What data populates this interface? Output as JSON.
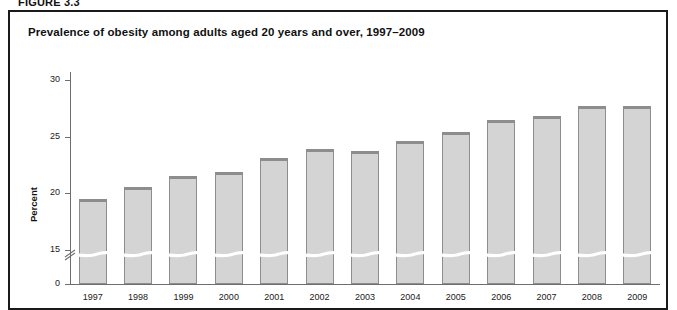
{
  "figure": {
    "label": "FIGURE 3.3"
  },
  "chart_title": "Prevalence of obesity among adults aged 20 years and over, 1997–2009",
  "axis": {
    "ylabel": "Percent",
    "yticks": [
      "0",
      "15",
      "20",
      "25",
      "30"
    ],
    "xlabel": ""
  },
  "chart_data": {
    "type": "bar",
    "title": "Prevalence of obesity among adults aged 20 years and over, 1997–2009",
    "xlabel": "",
    "ylabel": "Percent",
    "categories": [
      "1997",
      "1998",
      "1999",
      "2000",
      "2001",
      "2002",
      "2003",
      "2004",
      "2005",
      "2006",
      "2007",
      "2008",
      "2009"
    ],
    "values": [
      19.5,
      20.6,
      21.5,
      21.9,
      23.1,
      23.9,
      23.7,
      24.6,
      25.4,
      26.5,
      26.8,
      27.7,
      27.7
    ],
    "ylim": [
      0,
      30
    ],
    "ytick_values": [
      0,
      15,
      20,
      25,
      30
    ],
    "axis_break": true,
    "axis_break_between": [
      0,
      15
    ],
    "grid": false,
    "legend": "none",
    "bar_fill": "#d4d4d4",
    "bar_border": "#8d8d8d"
  },
  "colors": {
    "frame": "#1a1a1a",
    "axis": "#6e6e6e",
    "bar_fill": "#d4d4d4",
    "bar_border": "#8d8d8d",
    "text": "#1a1a1a"
  }
}
